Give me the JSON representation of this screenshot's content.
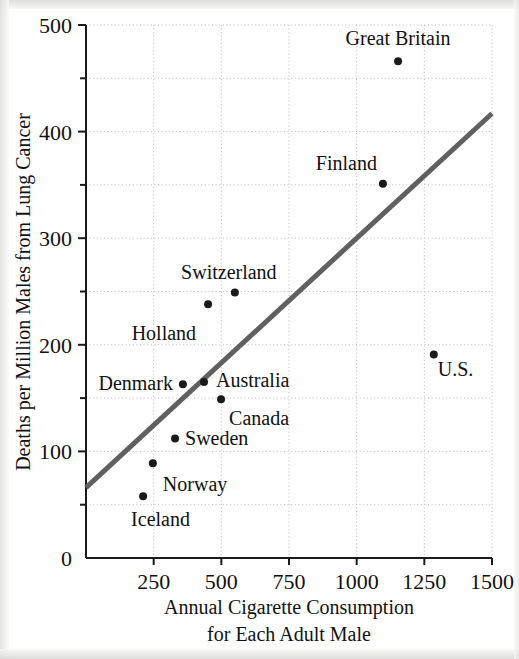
{
  "figure": {
    "kind": "scatterplot-with-regression-line",
    "background_color": "#ffffff"
  },
  "chart_data": {
    "type": "scatter",
    "title": "",
    "xlabel": "Annual Cigarette Consumption for Each Adult Male",
    "xlabel_line1": "Annual Cigarette Consumption",
    "xlabel_line2": "for Each Adult Male",
    "ylabel": "Deaths per Million Males from Lung Cancer",
    "xlim": [
      0,
      1500
    ],
    "ylim": [
      0,
      500
    ],
    "xticks": [
      0,
      250,
      500,
      750,
      1000,
      1250,
      1500
    ],
    "xtick_labels": [
      "0",
      "250",
      "500",
      "750",
      "1000",
      "1250",
      "1500"
    ],
    "yticks": [
      0,
      100,
      200,
      300,
      400,
      500
    ],
    "ytick_labels": [
      "0",
      "100",
      "200",
      "300",
      "400",
      "500"
    ],
    "y_minor_ticks": [
      50,
      150,
      250,
      350,
      450
    ],
    "grid": true,
    "grid_style": "dotted",
    "grid_color": "#b9b9b9",
    "legend": "none",
    "point_color": "#1a1a1a",
    "point_radius": 4,
    "points": [
      {
        "label": "Iceland",
        "x": 211,
        "y": 58,
        "label_dx": -12,
        "label_dy": 30,
        "anchor": "start"
      },
      {
        "label": "Norway",
        "x": 247,
        "y": 89,
        "label_dx": 10,
        "label_dy": 28,
        "anchor": "start"
      },
      {
        "label": "Sweden",
        "x": 329,
        "y": 112,
        "label_dx": 10,
        "label_dy": 6,
        "anchor": "start"
      },
      {
        "label": "Canada",
        "x": 499,
        "y": 149,
        "label_dx": 8,
        "label_dy": 26,
        "anchor": "start"
      },
      {
        "label": "Denmark",
        "x": 358,
        "y": 163,
        "label_dx": -10,
        "label_dy": 6,
        "anchor": "end"
      },
      {
        "label": "Australia",
        "x": 436,
        "y": 165,
        "label_dx": 12,
        "label_dy": 5,
        "anchor": "start"
      },
      {
        "label": "U.S.",
        "x": 1285,
        "y": 191,
        "label_dx": 4,
        "label_dy": 22,
        "anchor": "start"
      },
      {
        "label": "Holland",
        "x": 451,
        "y": 238,
        "label_dx": -12,
        "label_dy": 36,
        "anchor": "end"
      },
      {
        "label": "Switzerland",
        "x": 550,
        "y": 249,
        "label_dx": -6,
        "label_dy": -14,
        "anchor": "middle"
      },
      {
        "label": "Finland",
        "x": 1097,
        "y": 351,
        "label_dx": -6,
        "label_dy": -14,
        "anchor": "end"
      },
      {
        "label": "Great Britain",
        "x": 1153,
        "y": 466,
        "label_dx": 0,
        "label_dy": -16,
        "anchor": "middle"
      }
    ],
    "regression_line": {
      "x1": 0,
      "y1": 66,
      "x2": 1500,
      "y2": 417,
      "color": "#606060",
      "width": 5
    }
  }
}
